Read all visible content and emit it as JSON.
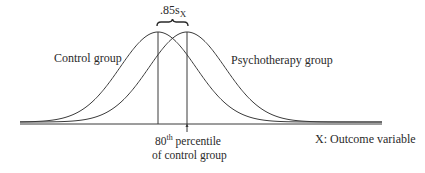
{
  "diagram": {
    "effect_label": {
      "value": ".85",
      "symbol": "s",
      "subscript": "X"
    },
    "control_label": "Control group",
    "treatment_label": "Psychotherapy group",
    "axis_label": "X: Outcome variable",
    "percentile_label": {
      "number": "80",
      "superscript": "th",
      "line1_rest": " percentile",
      "line2": "of control group"
    },
    "colors": {
      "stroke": "#3a3a3a",
      "text": "#2a2a2a",
      "background": "#ffffff"
    },
    "curves": [
      {
        "name": "Control group",
        "peak_x": 158,
        "sigma": 38
      },
      {
        "name": "Psychotherapy group",
        "peak_x": 187,
        "sigma": 38
      }
    ]
  }
}
